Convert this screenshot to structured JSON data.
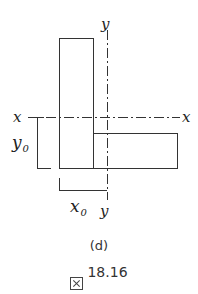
{
  "figure": {
    "labels": {
      "y_axis_top": "y",
      "y_axis_bottom": "y",
      "x_axis_left": "x",
      "x_axis_right": "x",
      "y_offset": "y",
      "y_offset_sub": "0",
      "x_offset": "x",
      "x_offset_sub": "0"
    },
    "shapes": {
      "vertical_plate": {
        "x": 59,
        "y": 38,
        "width": 34,
        "height": 130
      },
      "horizontal_plate": {
        "x": 93,
        "y": 133,
        "width": 84,
        "height": 35
      }
    },
    "axes": {
      "centroid_x": 107,
      "centroid_y": 117
    },
    "colors": {
      "stroke": "#333333",
      "background": "#ffffff"
    }
  },
  "caption": {
    "subfigure": "(d)",
    "figure_prefix_glyph": "図",
    "figure_number": "18.16"
  }
}
